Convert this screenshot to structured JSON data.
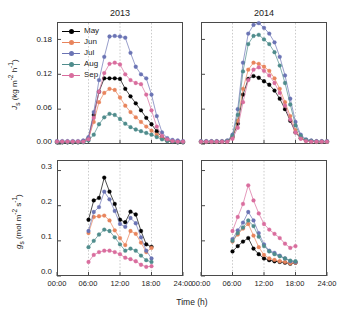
{
  "figure": {
    "panels": [
      {
        "id": "top-left",
        "title": "2013"
      },
      {
        "id": "top-right",
        "title": "2014"
      },
      {
        "id": "bottom-left",
        "title": ""
      },
      {
        "id": "bottom-right",
        "title": ""
      }
    ],
    "axis_labels": {
      "x": "Time (h)",
      "y_top_symbol": "J",
      "y_top_sub": "s",
      "y_top_units": "(kg m",
      "y_top_units2": "h",
      "y_bottom_symbol": "g",
      "y_bottom_sub": "s",
      "y_bottom_units": "(mol m",
      "y_bottom_units2": "s"
    },
    "y_top_full": "J s (kg m-2 h-1)",
    "y_bottom_full": "g s (mol m-2 s-1)",
    "xticks": [
      "00:00",
      "06:00",
      "12:00",
      "18:00",
      "24:00"
    ],
    "yticks_top": [
      "0.00",
      "0.06",
      "0.12",
      "0.18"
    ],
    "yticks_bottom": [
      "0.0",
      "0.1",
      "0.2",
      "0.3"
    ],
    "gridlines_hours": [
      6,
      12,
      18
    ]
  },
  "legend": {
    "position": "top-left-panel",
    "entries": [
      {
        "label": "May",
        "color": "#000000"
      },
      {
        "label": "Jun",
        "color": "#e8845c"
      },
      {
        "label": "Jul",
        "color": "#6b74b4"
      },
      {
        "label": "Aug",
        "color": "#4f8c8c"
      },
      {
        "label": "Sep",
        "color": "#d96d9e"
      }
    ]
  },
  "chart_data": [
    {
      "type": "line",
      "id": "js-2013",
      "title": "2013",
      "xlabel": "Time (h)",
      "ylabel": "Js (kg m-2 h-1)",
      "xlim": [
        0,
        24
      ],
      "ylim": [
        0,
        0.21
      ],
      "grid": true,
      "x": [
        0,
        1,
        2,
        3,
        4,
        5,
        6,
        7,
        8,
        9,
        10,
        11,
        12,
        13,
        14,
        15,
        16,
        17,
        18,
        19,
        20,
        21,
        22,
        23,
        24
      ],
      "series": [
        {
          "name": "May",
          "color": "#000000",
          "values": [
            0.003,
            0.003,
            0.003,
            0.003,
            0.003,
            0.004,
            0.01,
            0.05,
            0.09,
            0.113,
            0.113,
            0.113,
            0.112,
            0.095,
            0.082,
            0.07,
            0.058,
            0.045,
            0.034,
            0.022,
            0.012,
            0.006,
            0.004,
            0.003,
            0.003
          ]
        },
        {
          "name": "Jun",
          "color": "#e8845c",
          "values": [
            0.004,
            0.004,
            0.004,
            0.004,
            0.004,
            0.005,
            0.01,
            0.038,
            0.072,
            0.088,
            0.095,
            0.093,
            0.08,
            0.066,
            0.055,
            0.046,
            0.038,
            0.03,
            0.023,
            0.016,
            0.01,
            0.006,
            0.005,
            0.004,
            0.004
          ]
        },
        {
          "name": "Jul",
          "color": "#6b74b4",
          "values": [
            0.005,
            0.005,
            0.005,
            0.005,
            0.005,
            0.006,
            0.012,
            0.055,
            0.11,
            0.15,
            0.185,
            0.186,
            0.185,
            0.183,
            0.157,
            0.133,
            0.12,
            0.113,
            0.085,
            0.048,
            0.02,
            0.01,
            0.007,
            0.006,
            0.005
          ]
        },
        {
          "name": "Aug",
          "color": "#4f8c8c",
          "values": [
            0.003,
            0.003,
            0.003,
            0.003,
            0.003,
            0.003,
            0.006,
            0.016,
            0.034,
            0.046,
            0.052,
            0.05,
            0.043,
            0.035,
            0.029,
            0.025,
            0.022,
            0.019,
            0.016,
            0.012,
            0.008,
            0.005,
            0.004,
            0.003,
            0.003
          ]
        },
        {
          "name": "Sep",
          "color": "#d96d9e",
          "values": [
            0.004,
            0.004,
            0.004,
            0.004,
            0.004,
            0.004,
            0.008,
            0.045,
            0.09,
            0.122,
            0.138,
            0.14,
            0.137,
            0.12,
            0.11,
            0.105,
            0.103,
            0.085,
            0.058,
            0.03,
            0.014,
            0.008,
            0.005,
            0.004,
            0.004
          ]
        }
      ]
    },
    {
      "type": "line",
      "id": "js-2014",
      "title": "2014",
      "xlabel": "Time (h)",
      "ylabel": "Js (kg m-2 h-1)",
      "xlim": [
        0,
        24
      ],
      "ylim": [
        0,
        0.21
      ],
      "grid": true,
      "x": [
        0,
        1,
        2,
        3,
        4,
        5,
        6,
        7,
        8,
        9,
        10,
        11,
        12,
        13,
        14,
        15,
        16,
        17,
        18,
        19,
        20,
        21,
        22,
        23,
        24
      ],
      "series": [
        {
          "name": "May",
          "color": "#000000",
          "values": [
            0.004,
            0.004,
            0.004,
            0.004,
            0.004,
            0.005,
            0.012,
            0.035,
            0.085,
            0.112,
            0.117,
            0.114,
            0.108,
            0.102,
            0.092,
            0.078,
            0.06,
            0.04,
            0.02,
            0.01,
            0.006,
            0.005,
            0.004,
            0.004,
            0.004
          ]
        },
        {
          "name": "Jun",
          "color": "#e8845c",
          "values": [
            0.004,
            0.004,
            0.004,
            0.004,
            0.004,
            0.005,
            0.013,
            0.04,
            0.095,
            0.128,
            0.14,
            0.138,
            0.133,
            0.126,
            0.113,
            0.095,
            0.072,
            0.048,
            0.024,
            0.011,
            0.006,
            0.005,
            0.004,
            0.004,
            0.004
          ]
        },
        {
          "name": "Jul",
          "color": "#6b74b4",
          "values": [
            0.005,
            0.005,
            0.005,
            0.005,
            0.005,
            0.006,
            0.016,
            0.06,
            0.14,
            0.19,
            0.205,
            0.208,
            0.2,
            0.19,
            0.175,
            0.15,
            0.118,
            0.078,
            0.038,
            0.016,
            0.008,
            0.006,
            0.005,
            0.005,
            0.005
          ]
        },
        {
          "name": "Aug",
          "color": "#4f8c8c",
          "values": [
            0.004,
            0.004,
            0.004,
            0.004,
            0.004,
            0.005,
            0.014,
            0.05,
            0.125,
            0.172,
            0.186,
            0.188,
            0.18,
            0.172,
            0.158,
            0.135,
            0.105,
            0.068,
            0.032,
            0.014,
            0.007,
            0.005,
            0.004,
            0.004,
            0.004
          ]
        },
        {
          "name": "Sep",
          "color": "#d96d9e",
          "values": [
            0.004,
            0.004,
            0.004,
            0.004,
            0.004,
            0.004,
            0.009,
            0.028,
            0.072,
            0.11,
            0.128,
            0.132,
            0.126,
            0.118,
            0.105,
            0.088,
            0.066,
            0.042,
            0.02,
            0.009,
            0.005,
            0.004,
            0.004,
            0.004,
            0.004
          ]
        }
      ]
    },
    {
      "type": "line",
      "id": "gs-2013",
      "title": "",
      "xlabel": "Time (h)",
      "ylabel": "gs (mol m-2 s-1)",
      "xlim": [
        0,
        24
      ],
      "ylim": [
        0,
        0.33
      ],
      "grid": true,
      "x": [
        6,
        7,
        8,
        9,
        10,
        11,
        12,
        13,
        14,
        15,
        16,
        17,
        18
      ],
      "series": [
        {
          "name": "May",
          "color": "#000000",
          "values": [
            0.16,
            0.215,
            0.222,
            0.28,
            0.24,
            0.205,
            0.16,
            0.153,
            0.183,
            0.175,
            0.128,
            0.09,
            0.083
          ]
        },
        {
          "name": "Jun",
          "color": "#e8845c",
          "values": [
            0.122,
            0.168,
            0.17,
            0.172,
            0.158,
            0.13,
            0.108,
            0.088,
            0.128,
            0.12,
            0.095,
            0.068,
            0.08
          ]
        },
        {
          "name": "Jul",
          "color": "#6b74b4",
          "values": [
            0.128,
            0.182,
            0.196,
            0.24,
            0.218,
            0.185,
            0.148,
            0.14,
            0.165,
            0.15,
            0.11,
            0.072,
            0.05
          ]
        },
        {
          "name": "Aug",
          "color": "#4f8c8c",
          "values": [
            0.082,
            0.1,
            0.118,
            0.132,
            0.128,
            0.11,
            0.09,
            0.072,
            0.078,
            0.072,
            0.058,
            0.045,
            0.04
          ]
        },
        {
          "name": "Sep",
          "color": "#d96d9e",
          "values": [
            0.04,
            0.06,
            0.068,
            0.072,
            0.072,
            0.068,
            0.062,
            0.052,
            0.048,
            0.042,
            0.032,
            0.026,
            0.028
          ]
        }
      ]
    },
    {
      "type": "line",
      "id": "gs-2014",
      "title": "",
      "xlabel": "Time (h)",
      "ylabel": "gs (mol m-2 s-1)",
      "xlim": [
        0,
        24
      ],
      "ylim": [
        0,
        0.33
      ],
      "grid": true,
      "x": [
        6,
        7,
        8,
        9,
        10,
        11,
        12,
        13,
        14,
        15,
        16,
        17,
        18
      ],
      "series": [
        {
          "name": "May",
          "color": "#000000",
          "values": [
            0.07,
            0.085,
            0.098,
            0.108,
            0.078,
            0.062,
            0.05,
            0.045,
            0.042,
            0.04,
            0.038,
            0.035,
            0.038
          ]
        },
        {
          "name": "Jun",
          "color": "#e8845c",
          "values": [
            0.098,
            0.118,
            0.135,
            0.148,
            0.115,
            0.082,
            0.06,
            0.05,
            0.046,
            0.042,
            0.04,
            0.036,
            0.038
          ]
        },
        {
          "name": "Jul",
          "color": "#6b74b4",
          "values": [
            0.105,
            0.13,
            0.152,
            0.182,
            0.158,
            0.122,
            0.09,
            0.072,
            0.066,
            0.058,
            0.05,
            0.042,
            0.04
          ]
        },
        {
          "name": "Aug",
          "color": "#4f8c8c",
          "values": [
            0.1,
            0.122,
            0.138,
            0.158,
            0.142,
            0.112,
            0.085,
            0.07,
            0.062,
            0.056,
            0.05,
            0.044,
            0.042
          ]
        },
        {
          "name": "Sep",
          "color": "#d96d9e",
          "values": [
            0.128,
            0.168,
            0.205,
            0.258,
            0.215,
            0.178,
            0.148,
            0.132,
            0.12,
            0.108,
            0.092,
            0.08,
            0.085
          ]
        }
      ]
    }
  ]
}
